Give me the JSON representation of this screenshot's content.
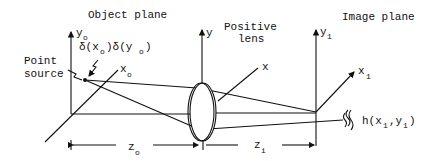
{
  "diagram": {
    "labels": {
      "object_plane": "Object plane",
      "image_plane": "Image plane",
      "positive_lens_line1": "Positive",
      "positive_lens_line2": "lens",
      "point_source_line1": "Point",
      "point_source_line2": "source",
      "delta_func": "δ(x",
      "delta_mid": ")δ(y",
      "delta_end": ")",
      "delta_sub": "o",
      "axis_yo": "y",
      "axis_yo_sub": "o",
      "axis_xo": "x",
      "axis_xo_sub": "o",
      "axis_y": "y",
      "axis_x": "x",
      "axis_y1": "y",
      "axis_y1_sub": "1",
      "axis_x1": "x",
      "axis_x1_sub": "1",
      "psf_prefix": "h(x",
      "psf_mid": ",y",
      "psf_end": ")",
      "psf_sub": "1",
      "dist_zo": "z",
      "dist_zo_sub": "o",
      "dist_zi": "z",
      "dist_zi_sub": "i"
    }
  }
}
